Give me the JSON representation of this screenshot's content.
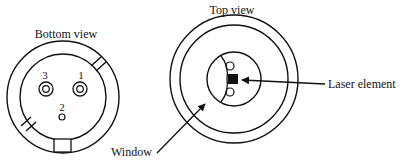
{
  "diagram": {
    "bottom_view": {
      "title": "Bottom view",
      "pins": [
        {
          "label": "3"
        },
        {
          "label": "1"
        },
        {
          "label": "2"
        }
      ]
    },
    "top_view": {
      "title": "Top view"
    },
    "callouts": {
      "laser_element": "Laser element",
      "window": "Window"
    },
    "colors": {
      "stroke": "#111111",
      "background": "#ffffff"
    }
  }
}
